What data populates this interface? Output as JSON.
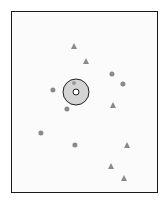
{
  "figure": {
    "width": 168,
    "height": 204,
    "background_color": "#ffffff",
    "canvas_color": "#fbfbfb",
    "frame": {
      "x": 11,
      "y": 11,
      "width": 147,
      "height": 182,
      "border_color": "#1a1a1a",
      "border_width": 1.4
    }
  },
  "chart_data": {
    "type": "scatter",
    "title": "",
    "subtitle": "",
    "xlabel": "",
    "ylabel": "",
    "xlim": [
      11,
      158
    ],
    "ylim": [
      11,
      193
    ],
    "grid": false,
    "legend": false,
    "legend_position": "none",
    "axis_ticks": false,
    "annotations": [],
    "series": [
      {
        "name": "circle-markers",
        "marker": "circle",
        "color": "#8a8a8a",
        "size": 5.2,
        "points": [
          {
            "x": 112,
            "y": 74
          },
          {
            "x": 123,
            "y": 84
          },
          {
            "x": 53,
            "y": 90
          },
          {
            "x": 67,
            "y": 109
          },
          {
            "x": 41,
            "y": 133
          },
          {
            "x": 75,
            "y": 145
          }
        ]
      },
      {
        "name": "triangle-markers",
        "marker": "triangle-up",
        "color": "#8a8a8a",
        "size": 7.2,
        "points": [
          {
            "x": 74,
            "y": 46
          },
          {
            "x": 86,
            "y": 61
          },
          {
            "x": 113,
            "y": 105
          },
          {
            "x": 127,
            "y": 145
          },
          {
            "x": 111,
            "y": 166
          },
          {
            "x": 124,
            "y": 178
          }
        ]
      },
      {
        "name": "target-marker",
        "marker": "bullseye",
        "color": "#1f1f1f",
        "fill_color": "#d4d4d4",
        "core_color": "#ffffff",
        "outer_diameter": 27,
        "outer_stroke": 1.8,
        "inner_diameter": 7.5,
        "inner_stroke": 1.8,
        "points": [
          {
            "x": 76,
            "y": 92
          }
        ]
      },
      {
        "name": "target-satellite-dot",
        "marker": "circle",
        "color": "#9a9a9a",
        "size": 4.0,
        "points": [
          {
            "x": 74,
            "y": 83
          }
        ]
      }
    ]
  }
}
